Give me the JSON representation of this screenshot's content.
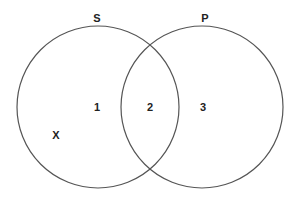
{
  "diagram": {
    "type": "venn",
    "circles": [
      {
        "label": "S",
        "cx": 98,
        "cy": 107,
        "r": 81
      },
      {
        "label": "P",
        "cx": 202,
        "cy": 107,
        "r": 81
      }
    ],
    "regions": [
      {
        "label": "1",
        "x": 97,
        "y": 107
      },
      {
        "label": "2",
        "x": 150,
        "y": 107
      },
      {
        "label": "3",
        "x": 203,
        "y": 107
      }
    ],
    "marker": {
      "label": "X",
      "x": 56,
      "y": 135
    },
    "stroke_color": "#555555"
  }
}
